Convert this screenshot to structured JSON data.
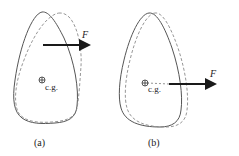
{
  "figure": {
    "panels": [
      {
        "id": "a",
        "caption": "(a)",
        "force_label": "F",
        "cg_label": "c.g.",
        "force_line_passes_through_cg": false,
        "description": "Force applied above the center of gravity; body rotates and translates"
      },
      {
        "id": "b",
        "caption": "(b)",
        "force_label": "F",
        "cg_label": "c.g.",
        "force_line_passes_through_cg": true,
        "description": "Force line passes through the center of gravity; body translates only"
      }
    ],
    "colors": {
      "outline": "#555555",
      "displaced_outline": "#8a8a8a",
      "arrow": "#1a1a1a",
      "text": "#222222"
    },
    "icons": {
      "cg_marker": "circle-plus-icon",
      "force_arrow": "arrow-right-icon"
    }
  }
}
